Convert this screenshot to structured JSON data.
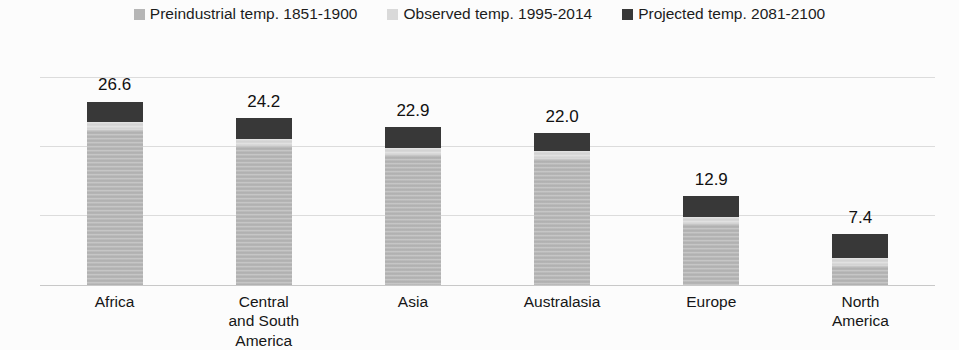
{
  "chart_data": {
    "type": "bar",
    "stacked": true,
    "title": "",
    "xlabel": "",
    "ylabel": "",
    "categories": [
      "Africa",
      "Central and South America",
      "Asia",
      "Australasia",
      "Europe",
      "North America"
    ],
    "series": [
      {
        "name": "Preindustrial temp. 1851-1900",
        "color": "#b6b6b6",
        "values": [
          22.4,
          20.2,
          18.8,
          18.3,
          8.8,
          2.8
        ]
      },
      {
        "name": "Observed temp. 1995-2014",
        "color": "#d9d9d9",
        "values": [
          1.2,
          1.0,
          1.0,
          1.1,
          1.1,
          1.1
        ]
      },
      {
        "name": "Projected temp. 2081-2100",
        "color": "#383838",
        "values": [
          3.0,
          3.0,
          3.1,
          2.6,
          3.0,
          3.5
        ]
      }
    ],
    "totals": [
      26.6,
      24.2,
      22.9,
      22.0,
      12.9,
      7.4
    ],
    "total_labels": [
      "26.6",
      "24.2",
      "22.9",
      "22.0",
      "12.9",
      "7.4"
    ],
    "ylim": [
      0,
      30
    ],
    "gridline_values": [
      10,
      20,
      30
    ],
    "grid": true,
    "legend_position": "top",
    "y_axis_tick_labels_visible": false,
    "colors": {
      "background": "#fcfcfc",
      "gridline": "#dcdcdc",
      "axis_line": "#c8c8c8",
      "text": "#1c1c1c"
    }
  }
}
